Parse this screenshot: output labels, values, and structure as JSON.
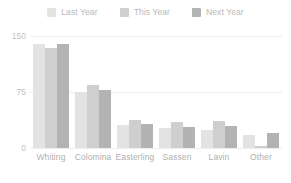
{
  "chart_data": {
    "type": "bar",
    "title": "",
    "subtitle": "",
    "xlabel": "",
    "ylabel": "",
    "categories": [
      "Whiting",
      "Colomina",
      "Easterling",
      "Sassen",
      "Lavin",
      "Other"
    ],
    "series": [
      {
        "name": "Last Year",
        "color": "#e3e3e3",
        "values": [
          139,
          75,
          31,
          27,
          24,
          17
        ]
      },
      {
        "name": "This Year",
        "color": "#cfcfcf",
        "values": [
          134,
          84,
          37,
          35,
          36,
          3
        ]
      },
      {
        "name": "Next Year",
        "color": "#b3b3b3",
        "values": [
          139,
          78,
          32,
          28,
          29,
          20
        ]
      }
    ],
    "ylim": [
      0,
      150
    ],
    "yticks": [
      0,
      75,
      150
    ],
    "ytick_labels": [
      "0",
      "75",
      "150"
    ],
    "grid": true,
    "legend_position": "top-center",
    "axis_label_color": "#b0b0b0",
    "gridline_color": "#ededed",
    "background_color": "#ffffff"
  }
}
